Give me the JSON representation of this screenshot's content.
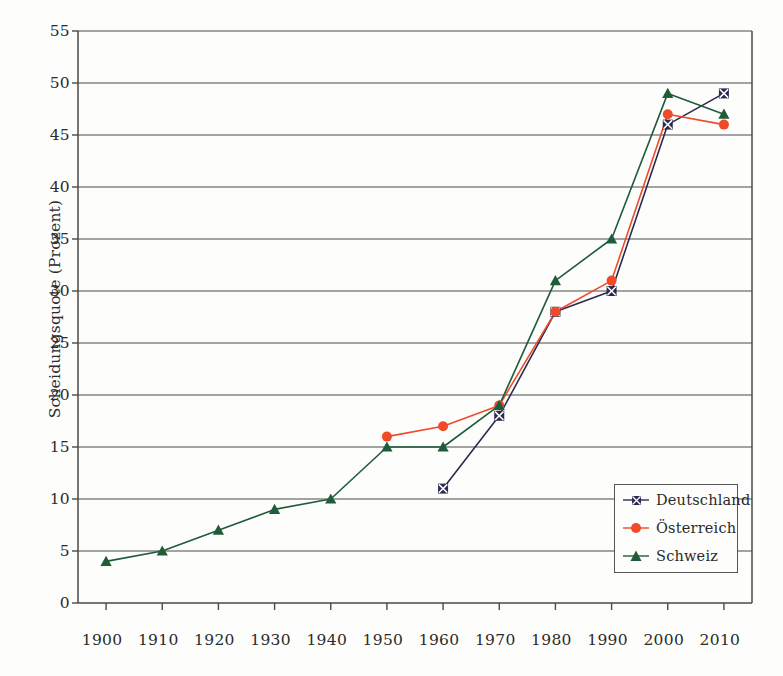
{
  "chart_data": {
    "type": "line",
    "title": "",
    "xlabel": "",
    "ylabel": "Scheidungsquote (Prozent)",
    "x": [
      1900,
      1910,
      1920,
      1930,
      1940,
      1950,
      1960,
      1970,
      1980,
      1990,
      2000,
      2010
    ],
    "categories": [
      "1900",
      "1910",
      "1920",
      "1930",
      "1940",
      "1950",
      "1960",
      "1970",
      "1980",
      "1990",
      "2000",
      "2010"
    ],
    "xlim": [
      1895,
      2015
    ],
    "ylim": [
      0,
      55
    ],
    "ytick_labels": [
      "0",
      "5",
      "10",
      "15",
      "20",
      "25",
      "30",
      "35",
      "40",
      "45",
      "50",
      "55"
    ],
    "yticks": [
      0,
      5,
      10,
      15,
      20,
      25,
      30,
      35,
      40,
      45,
      50,
      55
    ],
    "grid": "horizontal",
    "legend_position": "bottom-right",
    "series": [
      {
        "name": "Deutschland",
        "color": "#2a2a52",
        "marker": "x-square",
        "x": [
          1960,
          1970,
          1980,
          1990,
          2000,
          2010
        ],
        "values": [
          11,
          18,
          28,
          30,
          46,
          49
        ]
      },
      {
        "name": "Österreich",
        "color": "#f04a28",
        "marker": "circle",
        "x": [
          1950,
          1960,
          1970,
          1980,
          1990,
          2000,
          2010
        ],
        "values": [
          16,
          17,
          19,
          28,
          31,
          47,
          46
        ]
      },
      {
        "name": "Schweiz",
        "color": "#1f5c3a",
        "marker": "triangle",
        "x": [
          1900,
          1910,
          1920,
          1930,
          1940,
          1950,
          1960,
          1970,
          1980,
          1990,
          2000,
          2010
        ],
        "values": [
          4,
          5,
          7,
          9,
          10,
          15,
          15,
          19,
          31,
          35,
          49,
          47
        ]
      }
    ]
  },
  "legend": {
    "entries": [
      {
        "label": "Deutschland"
      },
      {
        "label": "Österreich"
      },
      {
        "label": "Schweiz"
      }
    ]
  },
  "axis": {
    "y_title": "Scheidungsquote (Prozent)"
  }
}
